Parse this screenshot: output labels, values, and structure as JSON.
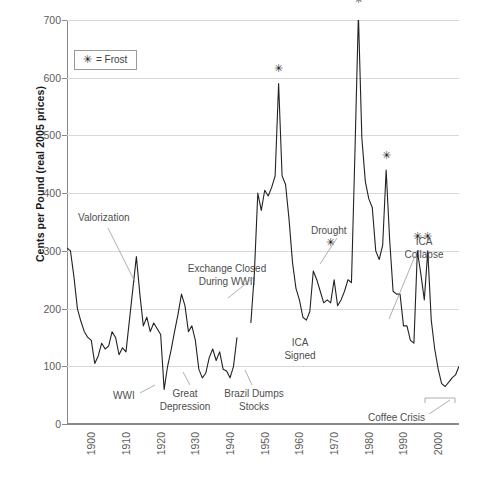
{
  "chart_data": {
    "type": "line",
    "title": "",
    "xlabel": "",
    "ylabel": "Cents per Pound (real 2005 prices)",
    "xlim": [
      1893,
      2006
    ],
    "ylim": [
      0,
      700
    ],
    "grid": true,
    "legend_position": "top-left-inside",
    "legend": [
      {
        "glyph": "✳",
        "label": "= Frost"
      }
    ],
    "yticks": [
      0,
      100,
      200,
      300,
      400,
      500,
      600,
      700
    ],
    "xticks": [
      1900,
      1910,
      1920,
      1930,
      1940,
      1950,
      1960,
      1970,
      1980,
      1990,
      2000
    ],
    "line_color": "#222222",
    "grid_color": "#d8d8d8",
    "axis_color": "#8a8a8a",
    "gap_note": "Series is interrupted 1942-1946 (exchange closed during WWII)",
    "series": [
      {
        "name": "Coffee price (cents per pound, real 2005 prices)",
        "segments": [
          {
            "name": "1893-1942",
            "x": [
              1893,
              1894,
              1895,
              1896,
              1897,
              1898,
              1899,
              1900,
              1901,
              1902,
              1903,
              1904,
              1905,
              1906,
              1907,
              1908,
              1909,
              1910,
              1911,
              1912,
              1913,
              1914,
              1915,
              1916,
              1917,
              1918,
              1919,
              1920,
              1921,
              1922,
              1923,
              1924,
              1925,
              1926,
              1927,
              1928,
              1929,
              1930,
              1931,
              1932,
              1933,
              1934,
              1935,
              1936,
              1937,
              1938,
              1939,
              1940,
              1941,
              1942
            ],
            "y": [
              305,
              300,
              255,
              200,
              178,
              160,
              150,
              145,
              105,
              118,
              140,
              130,
              135,
              160,
              150,
              120,
              132,
              125,
              180,
              235,
              290,
              225,
              170,
              185,
              160,
              175,
              165,
              155,
              60,
              100,
              128,
              160,
              190,
              225,
              205,
              160,
              170,
              145,
              95,
              80,
              88,
              115,
              130,
              110,
              125,
              95,
              92,
              80,
              100,
              150
            ]
          },
          {
            "name": "1946-2006",
            "x": [
              1946,
              1947,
              1948,
              1949,
              1950,
              1951,
              1952,
              1953,
              1954,
              1955,
              1956,
              1957,
              1958,
              1959,
              1960,
              1961,
              1962,
              1963,
              1964,
              1965,
              1966,
              1967,
              1968,
              1969,
              1970,
              1971,
              1972,
              1973,
              1974,
              1975,
              1976,
              1977,
              1978,
              1979,
              1980,
              1981,
              1982,
              1983,
              1984,
              1985,
              1986,
              1987,
              1988,
              1989,
              1990,
              1991,
              1992,
              1993,
              1994,
              1995,
              1996,
              1997,
              1998,
              1999,
              2000,
              2001,
              2002,
              2003,
              2004,
              2005,
              2006
            ],
            "y": [
              175,
              260,
              400,
              370,
              405,
              395,
              410,
              430,
              590,
              430,
              415,
              355,
              280,
              235,
              215,
              185,
              180,
              195,
              265,
              250,
              230,
              210,
              215,
              210,
              250,
              205,
              215,
              230,
              250,
              245,
              470,
              710,
              495,
              420,
              390,
              375,
              300,
              285,
              310,
              440,
              320,
              230,
              225,
              225,
              170,
              170,
              145,
              140,
              300,
              260,
              215,
              300,
              180,
              130,
              95,
              70,
              65,
              72,
              80,
              85,
              100
            ]
          }
        ]
      }
    ],
    "annotations": [
      {
        "id": "valorization",
        "label": "Valorization"
      },
      {
        "id": "wwi",
        "label": "WWI"
      },
      {
        "id": "great-depression",
        "label": "Great\nDepression"
      },
      {
        "id": "exchange-closed",
        "label": "Exchange Closed\nDuring WWII"
      },
      {
        "id": "brazil-dumps-stocks",
        "label": "Brazil Dumps\nStocks"
      },
      {
        "id": "ica-signed",
        "label": "ICA\nSigned"
      },
      {
        "id": "drought",
        "label": "Drought"
      },
      {
        "id": "ica-collapse",
        "label": "ICA\nCollapse"
      },
      {
        "id": "coffee-crisis",
        "label": "Coffee Crisis"
      }
    ],
    "frost_markers": [
      {
        "year": 1954,
        "value": 590
      },
      {
        "year": 1969,
        "value": 290
      },
      {
        "year": 1977,
        "value": 710
      },
      {
        "year": 1985,
        "value": 440
      },
      {
        "year": 1994,
        "value": 300
      },
      {
        "year": 1997,
        "value": 300
      }
    ]
  },
  "annotations": {
    "valorization": "Valorization",
    "wwi": "WWI",
    "great_depression_line1": "Great",
    "great_depression_line2": "Depression",
    "exchange_closed_line1": "Exchange Closed",
    "exchange_closed_line2": "During WWII",
    "brazil_dumps_line1": "Brazil Dumps",
    "brazil_dumps_line2": "Stocks",
    "ica_signed_line1": "ICA",
    "ica_signed_line2": "Signed",
    "drought": "Drought",
    "ica_collapse_line1": "ICA",
    "ica_collapse_line2": "Collapse",
    "coffee_crisis": "Coffee Crisis"
  },
  "legend": {
    "glyph": "✳",
    "text": "= Frost"
  },
  "axis": {
    "y_title": "Cents per Pound (real 2005 prices)",
    "y_labels": [
      "0",
      "100",
      "200",
      "300",
      "400",
      "500",
      "600",
      "700"
    ],
    "x_labels": [
      "1900",
      "1910",
      "1920",
      "1930",
      "1940",
      "1950",
      "1960",
      "1970",
      "1980",
      "1990",
      "2000"
    ]
  }
}
